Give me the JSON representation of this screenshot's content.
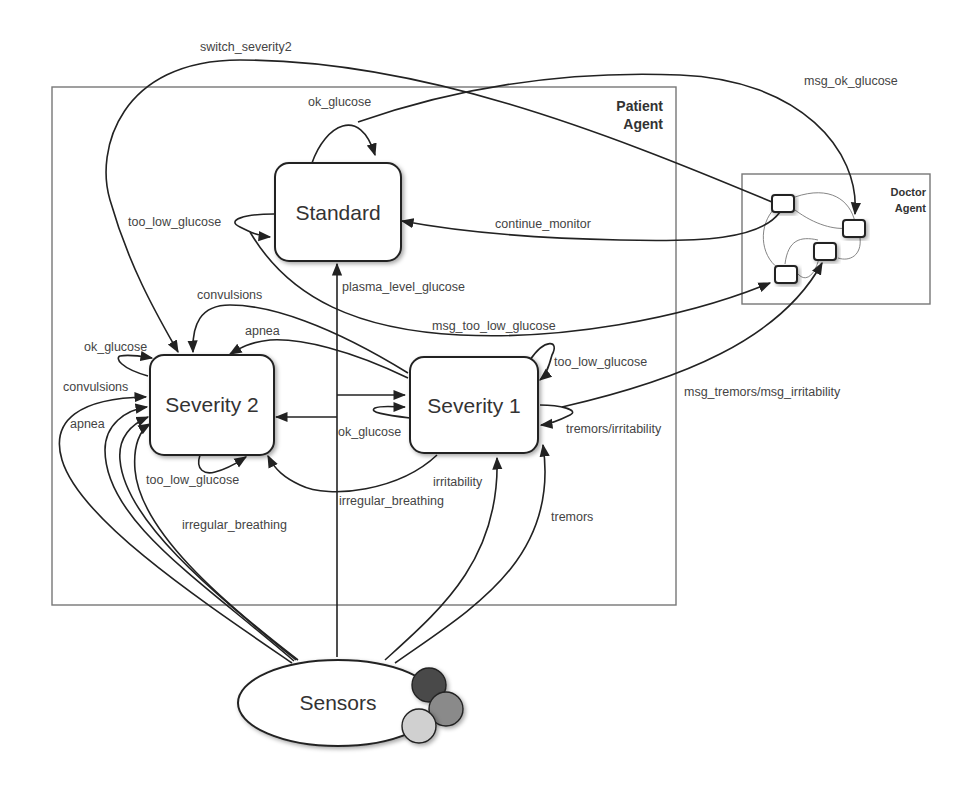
{
  "containers": {
    "patient": {
      "line1": "Patient",
      "line2": "Agent"
    },
    "doctor": {
      "line1": "Doctor",
      "line2": "Agent"
    }
  },
  "states": {
    "standard": "Standard",
    "severity2": "Severity 2",
    "severity1": "Severity 1",
    "sensors": "Sensors"
  },
  "edges": {
    "switch_severity2": "switch_severity2",
    "msg_ok_glucose": "msg_ok_glucose",
    "standard_ok_glucose": "ok_glucose",
    "standard_too_low_glucose": "too_low_glucose",
    "continue_monitor": "continue_monitor",
    "plasma_level_glucose": "plasma_level_glucose",
    "msg_too_low_glucose": "msg_too_low_glucose",
    "s2_convulsions_top": "convulsions",
    "s2_apnea_top": "apnea",
    "s2_ok_glucose": "ok_glucose",
    "s2_convulsions_left": "convulsions",
    "s2_apnea_left": "apnea",
    "s2_too_low_glucose": "too_low_glucose",
    "s1_too_low_glucose": "too_low_glucose",
    "s1_ok_glucose": "ok_glucose",
    "s1_tremors_irritability": "tremors/irritability",
    "msg_tremors_irritability": "msg_tremors/msg_irritability",
    "irregular_breathing_s1": "irregular_breathing",
    "irritability": "irritability",
    "irregular_breathing_sensors": "irregular_breathing",
    "tremors": "tremors"
  },
  "colors": {
    "sensor_dark": "#4a4a4a",
    "sensor_mid": "#8a8a8a",
    "sensor_light": "#d0d0d0",
    "stroke": "#222222",
    "text": "#444444"
  }
}
